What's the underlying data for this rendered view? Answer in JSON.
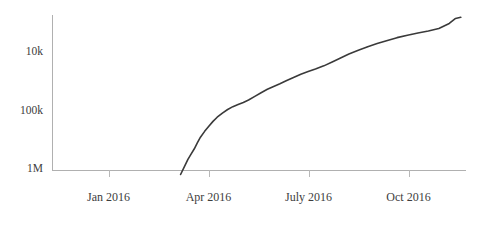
{
  "chart_data": {
    "type": "line",
    "title": "",
    "subtitle": "",
    "xlabel": "",
    "ylabel": "",
    "grid": false,
    "legend": null,
    "y_scale": "log",
    "y_inverted": true,
    "ylim": [
      1000000,
      8000
    ],
    "yticks": [
      {
        "value": 10000,
        "label": "10k"
      },
      {
        "value": 100000,
        "label": "100k"
      },
      {
        "value": 1000000,
        "label": "1M"
      }
    ],
    "xticks": [
      {
        "value": "2016-01-01",
        "label": "Jan 2016"
      },
      {
        "value": "2016-04-01",
        "label": "Apr 2016"
      },
      {
        "value": "2016-07-01",
        "label": "July 2016"
      },
      {
        "value": "2016-10-01",
        "label": "Oct 2016"
      }
    ],
    "xlim": [
      "2015-11-20",
      "2016-12-20"
    ],
    "series": [
      {
        "name": "rank",
        "color": "#3a3a3a",
        "x": [
          "2016-03-22",
          "2016-03-26",
          "2016-03-29",
          "2016-04-01",
          "2016-04-04",
          "2016-04-07",
          "2016-04-10",
          "2016-04-14",
          "2016-04-18",
          "2016-04-22",
          "2016-04-26",
          "2016-05-01",
          "2016-05-06",
          "2016-05-11",
          "2016-05-16",
          "2016-05-21",
          "2016-05-26",
          "2016-06-01",
          "2016-06-07",
          "2016-06-13",
          "2016-06-19",
          "2016-06-25",
          "2016-07-01",
          "2016-07-08",
          "2016-07-15",
          "2016-07-22",
          "2016-07-29",
          "2016-08-06",
          "2016-08-14",
          "2016-08-22",
          "2016-08-30",
          "2016-09-08",
          "2016-09-17",
          "2016-09-26",
          "2016-10-05",
          "2016-10-15",
          "2016-10-25",
          "2016-11-04",
          "2016-11-14",
          "2016-11-24",
          "2016-12-04",
          "2016-12-10",
          "2016-12-15"
        ],
        "y": [
          1150000,
          880000,
          720000,
          610000,
          520000,
          430000,
          360000,
          300000,
          256000,
          220000,
          193000,
          170000,
          152000,
          139000,
          130000,
          122000,
          113000,
          101000,
          90000,
          81000,
          74000,
          68000,
          62000,
          56000,
          50500,
          46500,
          43000,
          39000,
          34500,
          30500,
          27000,
          24000,
          21500,
          19500,
          17800,
          16200,
          15000,
          14000,
          13200,
          12200,
          10400,
          8900,
          8600
        ]
      }
    ]
  },
  "axes_geometry": {
    "plot_left": 52,
    "plot_right": 466,
    "plot_top": 15,
    "plot_bottom": 170,
    "xtick_x": [
      108.5,
      208.5,
      308.5,
      408.5
    ],
    "ytick_y": [
      52,
      111,
      169
    ]
  }
}
